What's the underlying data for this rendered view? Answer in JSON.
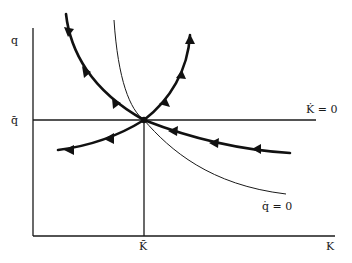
{
  "diagram": {
    "type": "phase-diagram",
    "axes": {
      "x_label": "K",
      "y_label": "q",
      "x_tick_label": "K̄",
      "y_tick_label": "q̄"
    },
    "loci": {
      "k_dot_zero": "K̇ = 0",
      "q_dot_zero": "q̇ = 0"
    },
    "colors": {
      "ink": "#111111",
      "background": "#ffffff"
    },
    "paths": [
      {
        "name": "stable-saddle-path-upper-left",
        "direction": "toward steady state"
      },
      {
        "name": "stable-saddle-path-lower-right",
        "direction": "toward steady state"
      },
      {
        "name": "unstable-path-upper-right",
        "direction": "away from steady state"
      },
      {
        "name": "unstable-path-lower-left",
        "direction": "away from steady state"
      }
    ]
  }
}
